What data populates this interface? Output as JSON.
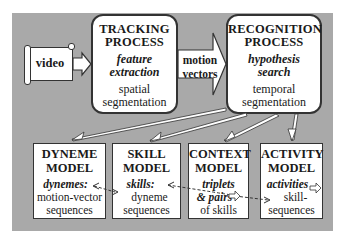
{
  "input": {
    "label": "video",
    "icon": "scroll-icon"
  },
  "tracking": {
    "title1": "TRACKING",
    "title2": "PROCESS",
    "italic1": "feature",
    "italic2": "extraction",
    "plain1": "spatial",
    "plain2": "segmentation"
  },
  "motion_arrow": {
    "line1": "motion",
    "line2": "vectors"
  },
  "recognition": {
    "title1": "RECOGNITION",
    "title2": "PROCESS",
    "italic1": "hypothesis",
    "italic2": "search",
    "plain1": "temporal",
    "plain2": "segmentation"
  },
  "models": [
    {
      "title1": "DYNEME",
      "title2": "MODEL",
      "italic": "dynemes:",
      "plain1": "motion-vector",
      "plain2": "sequences"
    },
    {
      "title1": "SKILL",
      "title2": "MODEL",
      "italic": "skills:",
      "plain1": "dyneme",
      "plain2": "sequences"
    },
    {
      "title1": "CONTEXT",
      "title2": "MODEL",
      "italic1": "triplets",
      "italic2": "& pairs",
      "plain1": "of skills"
    },
    {
      "title1": "ACTIVITY",
      "title2": "MODEL",
      "italic": "activities",
      "plain1": "skill-",
      "plain2": "sequences"
    }
  ],
  "colors": {
    "panel": "#a9a9a9",
    "box_fill": "#ffffff",
    "border": "#333333"
  }
}
